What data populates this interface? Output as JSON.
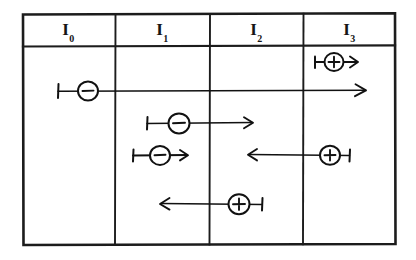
{
  "figure": {
    "kind": "hand-drawn-diagram",
    "ink_color": "#111111",
    "paper_color": "#ffffff"
  },
  "table": {
    "columns": [
      {
        "id": "I0",
        "base": "I",
        "subscript": "0",
        "label": "I₀",
        "x_left": 22,
        "x_right": 115
      },
      {
        "id": "I1",
        "base": "I",
        "subscript": "1",
        "label": "I₁",
        "x_left": 115,
        "x_right": 210
      },
      {
        "id": "I2",
        "base": "I",
        "subscript": "2",
        "label": "I₂",
        "x_left": 210,
        "x_right": 303
      },
      {
        "id": "I3",
        "base": "I",
        "subscript": "3",
        "label": "I₃",
        "x_left": 303,
        "x_right": 396
      }
    ],
    "frame": {
      "x": 22,
      "y": 13,
      "width": 374,
      "height": 232
    },
    "header_rule_y": 46
  },
  "tracks": [
    {
      "name": "track-plus-i3-short",
      "charge": "+",
      "charge_symbol": "⊕",
      "direction": "right",
      "y": 62,
      "tail_x": 315,
      "head_x": 358,
      "circle_x": 334,
      "columns_spanned": [
        "I3"
      ]
    },
    {
      "name": "track-minus-long",
      "charge": "−",
      "charge_symbol": "⊖",
      "direction": "right",
      "y": 91,
      "tail_x": 58,
      "head_x": 366,
      "circle_x": 88,
      "columns_spanned": [
        "I0",
        "I1",
        "I2",
        "I3"
      ]
    },
    {
      "name": "track-minus-i1-to-i2",
      "charge": "−",
      "charge_symbol": "⊖",
      "direction": "right",
      "y": 123,
      "tail_x": 147,
      "head_x": 253,
      "circle_x": 179,
      "columns_spanned": [
        "I1",
        "I2"
      ]
    },
    {
      "name": "track-minus-i1-short",
      "charge": "−",
      "charge_symbol": "⊖",
      "direction": "right",
      "y": 155,
      "tail_x": 133,
      "head_x": 188,
      "circle_x": 160,
      "columns_spanned": [
        "I1"
      ]
    },
    {
      "name": "track-plus-i3-to-i2-left",
      "charge": "+",
      "charge_symbol": "⊕",
      "direction": "left",
      "y": 155,
      "tail_x": 350,
      "head_x": 248,
      "circle_x": 330,
      "columns_spanned": [
        "I2",
        "I3"
      ]
    },
    {
      "name": "track-plus-i2-to-i1-left",
      "charge": "+",
      "charge_symbol": "⊕",
      "direction": "left",
      "y": 204,
      "tail_x": 262,
      "head_x": 160,
      "circle_x": 239,
      "columns_spanned": [
        "I1",
        "I2"
      ]
    }
  ]
}
